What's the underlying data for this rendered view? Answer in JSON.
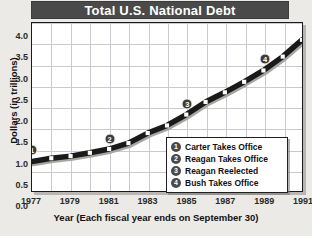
{
  "chart_data": {
    "type": "line",
    "title": "Total U.S. National Debt",
    "xlabel": "Year (Each fiscal year ends on September 30)",
    "ylabel": "Dollars (in trillions)",
    "xlim": [
      1977,
      1991
    ],
    "ylim": [
      0.0,
      4.0
    ],
    "grid": true,
    "legend_position": "inside-lower-right",
    "x": [
      1977,
      1978,
      1979,
      1980,
      1981,
      1982,
      1983,
      1984,
      1985,
      1986,
      1987,
      1988,
      1989,
      1990,
      1991
    ],
    "values": [
      0.7,
      0.78,
      0.83,
      0.91,
      1.0,
      1.14,
      1.38,
      1.56,
      1.82,
      2.12,
      2.35,
      2.6,
      2.87,
      3.2,
      3.6
    ],
    "ytick_labels": [
      "0.0",
      "0.5",
      "1.0",
      "1.5",
      "2.0",
      "2.5",
      "3.0",
      "3.5",
      "4.0"
    ],
    "ytick_values": [
      0.0,
      0.5,
      1.0,
      1.5,
      2.0,
      2.5,
      3.0,
      3.5,
      4.0
    ],
    "xtick_labels": [
      "1977",
      "1979",
      "1981",
      "1983",
      "1985",
      "1987",
      "1989",
      "1991"
    ],
    "xtick_values": [
      1977,
      1979,
      1981,
      1983,
      1985,
      1987,
      1989,
      1991
    ],
    "series_color": "#1a1a1a",
    "marker_color": "#ffffff",
    "grid_color": "#c9c9cf",
    "title_bg_color": "#4a4a4a",
    "annotations": [
      {
        "id": "1",
        "label": "Carter Takes Office",
        "x": 1977,
        "y": 1.02
      },
      {
        "id": "2",
        "label": "Reagan Takes Office",
        "x": 1981,
        "y": 1.27
      },
      {
        "id": "3",
        "label": "Reagan Reelected",
        "x": 1985,
        "y": 2.1
      },
      {
        "id": "4",
        "label": "Bush Takes Office",
        "x": 1989,
        "y": 3.15
      }
    ]
  },
  "legend": {
    "items": [
      {
        "id": "1",
        "label": "Carter Takes Office"
      },
      {
        "id": "2",
        "label": "Reagan Takes Office"
      },
      {
        "id": "3",
        "label": "Reagan Reelected"
      },
      {
        "id": "4",
        "label": "Bush Takes Office"
      }
    ]
  }
}
